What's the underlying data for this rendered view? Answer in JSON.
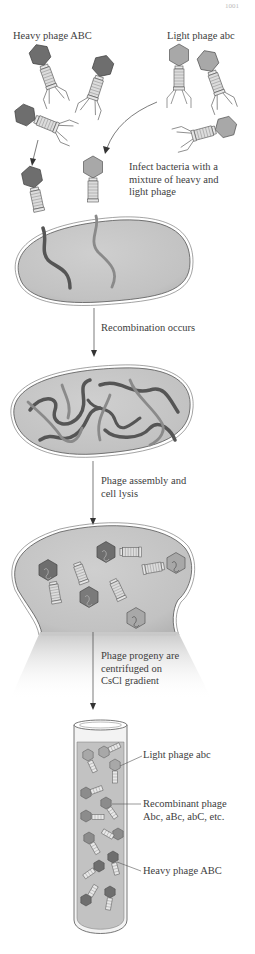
{
  "header": {
    "page_number": "1001"
  },
  "stage1": {
    "heavy_label": "Heavy phage ABC",
    "light_label": "Light phage abc",
    "infect_label": [
      "Infect bacteria with a",
      "mixture of heavy and",
      "light phage"
    ]
  },
  "stage2": {
    "label": "Recombination occurs"
  },
  "stage3": {
    "label": [
      "Phage assembly and",
      "cell lysis"
    ]
  },
  "stage4": {
    "label": [
      "Phage progeny are",
      "centrifuged on",
      "CsCl gradient"
    ]
  },
  "tube": {
    "bands": [
      {
        "label": [
          "Light phage abc"
        ]
      },
      {
        "label": [
          "Recombinant phage",
          "Abc, aBc, abC, etc."
        ]
      },
      {
        "label": [
          "Heavy phage ABC"
        ]
      }
    ]
  },
  "colors": {
    "heavy_head": "#6e6e6e",
    "light_head": "#a8a8a8",
    "cell_fill": "#c4c4c4",
    "tube_fill": "#c2c2c2",
    "dna_dark": "#555555",
    "dna_light": "#8a8a8a"
  }
}
